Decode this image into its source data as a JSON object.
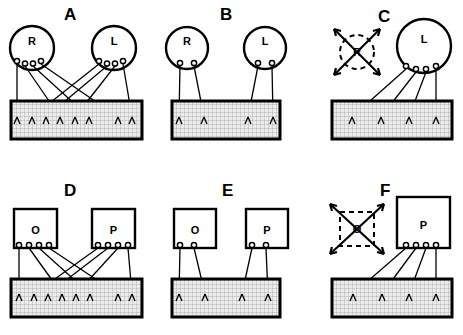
{
  "figure": {
    "type": "diagram",
    "panels": [
      {
        "id": "A",
        "label": "A",
        "source_shape": "circle",
        "sources": [
          {
            "label": "R",
            "side": "left",
            "terminals": 4,
            "state": "intact",
            "size": "normal"
          },
          {
            "label": "L",
            "side": "right",
            "terminals": 4,
            "state": "intact",
            "size": "normal"
          }
        ],
        "target": {
          "shape": "rectangle",
          "fill": "stippled",
          "endings": 8
        },
        "projection": "interdigitated-crossed",
        "crossing": true
      },
      {
        "id": "B",
        "label": "B",
        "source_shape": "circle",
        "sources": [
          {
            "label": "R",
            "side": "left",
            "terminals": 2,
            "state": "intact",
            "size": "normal"
          },
          {
            "label": "L",
            "side": "right",
            "terminals": 2,
            "state": "intact",
            "size": "normal"
          }
        ],
        "target": {
          "shape": "rectangle",
          "fill": "stippled",
          "endings": 4
        },
        "projection": "segregated-uncrossed",
        "crossing": false
      },
      {
        "id": "C",
        "label": "C",
        "source_shape": "circle",
        "sources": [
          {
            "label": "R",
            "side": "left",
            "terminals": 0,
            "state": "ablated",
            "size": "reduced"
          },
          {
            "label": "L",
            "side": "right",
            "terminals": 4,
            "state": "intact",
            "size": "enlarged"
          }
        ],
        "target": {
          "shape": "rectangle",
          "fill": "stippled",
          "endings": 4
        },
        "projection": "expanded-from-remaining-eye",
        "crossing": false
      },
      {
        "id": "D",
        "label": "D",
        "source_shape": "square",
        "sources": [
          {
            "label": "O",
            "side": "left",
            "terminals": 4,
            "state": "intact",
            "size": "normal"
          },
          {
            "label": "P",
            "side": "right",
            "terminals": 4,
            "state": "intact",
            "size": "normal"
          }
        ],
        "target": {
          "shape": "rectangle",
          "fill": "stippled",
          "endings": 8
        },
        "projection": "interdigitated-crossed",
        "crossing": true
      },
      {
        "id": "E",
        "label": "E",
        "source_shape": "square",
        "sources": [
          {
            "label": "O",
            "side": "left",
            "terminals": 2,
            "state": "intact",
            "size": "normal"
          },
          {
            "label": "P",
            "side": "right",
            "terminals": 2,
            "state": "intact",
            "size": "normal"
          }
        ],
        "target": {
          "shape": "rectangle",
          "fill": "stippled",
          "endings": 4
        },
        "projection": "segregated-uncrossed",
        "crossing": false
      },
      {
        "id": "F",
        "label": "F",
        "source_shape": "square",
        "sources": [
          {
            "label": "O",
            "side": "left",
            "terminals": 0,
            "state": "ablated",
            "size": "reduced"
          },
          {
            "label": "P",
            "side": "right",
            "terminals": 4,
            "state": "intact",
            "size": "enlarged"
          }
        ],
        "target": {
          "shape": "rectangle",
          "fill": "stippled",
          "endings": 4
        },
        "projection": "expanded-from-remaining-source",
        "crossing": false
      }
    ],
    "legend": {
      "ablation_marker": "dashed outline crossed by an X with arrowheads",
      "terminal_marker": "small open circle on source boundary",
      "ending_marker": "branched claw-shaped axon ending"
    },
    "colors": {
      "stroke": "#000000",
      "background": "#ffffff",
      "target_fill": "#e8e8e8"
    }
  }
}
